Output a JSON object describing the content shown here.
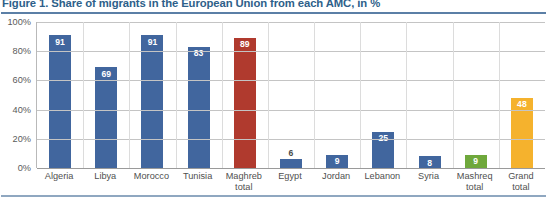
{
  "figure": {
    "title": "Figure 1. Share of migrants in the European Union from each AMC, in %"
  },
  "colors": {
    "blue": "#41669E",
    "red": "#B03A2E",
    "green": "#6FA83C",
    "orange": "#F5B22D",
    "title": "#2e5f8a",
    "grid": "#c4c4c4",
    "axis": "#9a9a9a"
  },
  "chart_data": {
    "type": "bar",
    "title": "Figure 1. Share of migrants in the European Union from each AMC, in %",
    "xlabel": "",
    "ylabel": "",
    "ylim": [
      0,
      100
    ],
    "yticks": [
      0,
      20,
      40,
      60,
      80,
      100
    ],
    "ytick_labels": [
      "0%",
      "20%",
      "40%",
      "60%",
      "80%",
      "100%"
    ],
    "grid": true,
    "legend": "none",
    "categories": [
      "Algeria",
      "Libya",
      "Morocco",
      "Tunisia",
      "Maghreb total",
      "Egypt",
      "Jordan",
      "Lebanon",
      "Syria",
      "Mashreq total",
      "Grand total"
    ],
    "values": [
      91,
      69,
      91,
      83,
      89,
      6,
      9,
      25,
      8,
      9,
      48
    ],
    "bar_colors": [
      "#41669E",
      "#41669E",
      "#41669E",
      "#41669E",
      "#B03A2E",
      "#41669E",
      "#41669E",
      "#41669E",
      "#41669E",
      "#6FA83C",
      "#F5B22D"
    ],
    "data_labels": [
      "91",
      "69",
      "91",
      "83",
      "89",
      "6",
      "9",
      "25",
      "8",
      "9",
      "48"
    ],
    "label_position": [
      "inside",
      "inside",
      "inside",
      "inside",
      "inside",
      "outside",
      "inside",
      "inside",
      "inside",
      "inside",
      "inside"
    ]
  },
  "axis": {
    "x_label_lines": [
      [
        "Algeria"
      ],
      [
        "Libya"
      ],
      [
        "Morocco"
      ],
      [
        "Tunisia"
      ],
      [
        "Maghreb",
        "total"
      ],
      [
        "Egypt"
      ],
      [
        "Jordan"
      ],
      [
        "Lebanon"
      ],
      [
        "Syria"
      ],
      [
        "Mashreq",
        "total"
      ],
      [
        "Grand",
        "total"
      ]
    ]
  }
}
